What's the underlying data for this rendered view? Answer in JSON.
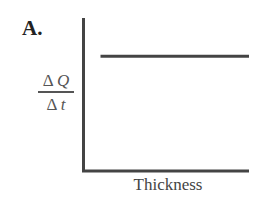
{
  "chart_data": {
    "type": "line",
    "panel_label": "A.",
    "title": "",
    "xlabel": "Thickness",
    "ylabel": "ΔQ/Δt",
    "ylabel_parts": {
      "numerator": "Δ Q",
      "denominator": "Δ t"
    },
    "series": [
      {
        "name": "heat flow rate",
        "x": [
          0.1,
          1.0
        ],
        "values": [
          0.75,
          0.75
        ]
      }
    ],
    "xlim": [
      0,
      1
    ],
    "ylim": [
      0,
      1
    ],
    "grid": false,
    "ticks": false,
    "legend": "none",
    "line_color": "#444444"
  },
  "labels": {
    "panel": "A.",
    "y_num_delta": "Δ",
    "y_num_var": "Q",
    "y_den_delta": "Δ",
    "y_den_var": "t",
    "x": "Thickness"
  }
}
